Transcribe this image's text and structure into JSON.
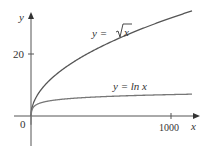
{
  "chart_data": {
    "type": "line",
    "title": "",
    "xlabel": "x",
    "ylabel": "y",
    "x_ticks": [
      "0",
      "1000"
    ],
    "y_ticks": [
      "20"
    ],
    "origin_label": "0",
    "xlim": [
      0,
      1150
    ],
    "ylim": [
      -8,
      33
    ],
    "grid": false,
    "legend": "inline annotations",
    "series": [
      {
        "name": "y = √x",
        "function": "sqrt(x)",
        "color": "#555555",
        "x": [
          0,
          50,
          100,
          200,
          400,
          600,
          800,
          1000,
          1150
        ],
        "values": [
          0,
          7.07,
          10,
          14.14,
          20,
          24.49,
          28.28,
          31.62,
          33.91
        ]
      },
      {
        "name": "y = ln x",
        "function": "ln(x)",
        "color": "#777777",
        "x": [
          0.5,
          1,
          10,
          50,
          100,
          200,
          400,
          600,
          800,
          1000,
          1150
        ],
        "values": [
          -0.69,
          0,
          2.3,
          3.91,
          4.61,
          5.3,
          5.99,
          6.4,
          6.68,
          6.91,
          7.05
        ]
      }
    ],
    "annotations": [
      "y = √x",
      "y = ln x"
    ]
  },
  "labels": {
    "y_axis": "y",
    "x_axis": "x",
    "origin": "0",
    "y_tick_20": "20",
    "x_tick_1000": "1000",
    "sqrt_prefix": "y = ",
    "sqrt_arg": "x",
    "ln_label": "y = ln x"
  }
}
